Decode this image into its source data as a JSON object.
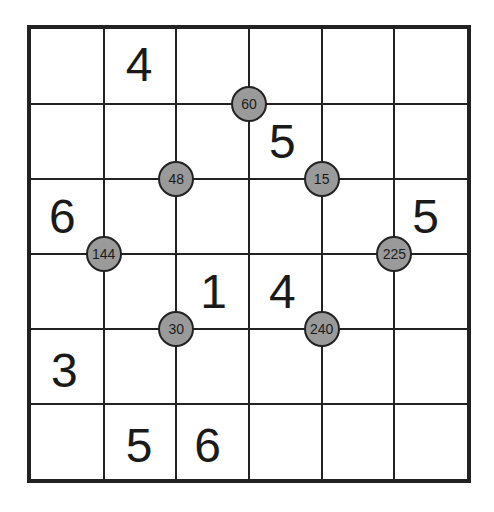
{
  "puzzle": {
    "rows": 6,
    "cols": 6,
    "colors": {
      "line": "#222222",
      "circle_fill": "#9a9a9a",
      "text": "#1a1a1a",
      "background": "#ffffff"
    },
    "givens": [
      {
        "row": 0,
        "col": 1,
        "value": "4",
        "dx": 22,
        "dy": 12
      },
      {
        "row": 1,
        "col": 3,
        "value": "5",
        "dx": 20,
        "dy": 14
      },
      {
        "row": 2,
        "col": 0,
        "value": "6",
        "dx": 18,
        "dy": 14
      },
      {
        "row": 2,
        "col": 5,
        "value": "5",
        "dx": 18,
        "dy": 14
      },
      {
        "row": 3,
        "col": 2,
        "value": "1",
        "dx": 24,
        "dy": 14
      },
      {
        "row": 3,
        "col": 3,
        "value": "4",
        "dx": 20,
        "dy": 14
      },
      {
        "row": 4,
        "col": 0,
        "value": "3",
        "dx": 20,
        "dy": 18
      },
      {
        "row": 5,
        "col": 1,
        "value": "5",
        "dx": 22,
        "dy": 18
      },
      {
        "row": 5,
        "col": 2,
        "value": "6",
        "dx": 18,
        "dy": 18
      }
    ],
    "product_clues": [
      {
        "value": "60",
        "gx": 3,
        "gy": 1
      },
      {
        "value": "48",
        "gx": 2,
        "gy": 2
      },
      {
        "value": "15",
        "gx": 4,
        "gy": 2
      },
      {
        "value": "144",
        "gx": 1,
        "gy": 3
      },
      {
        "value": "225",
        "gx": 5,
        "gy": 3
      },
      {
        "value": "30",
        "gx": 2,
        "gy": 4
      },
      {
        "value": "240",
        "gx": 4,
        "gy": 4
      }
    ]
  }
}
